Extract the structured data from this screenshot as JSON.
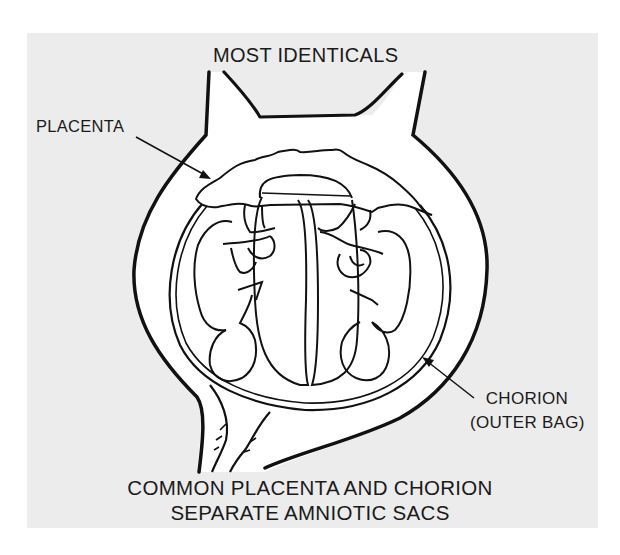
{
  "diagram": {
    "title": "MOST IDENTICALS",
    "labels": {
      "placenta": "PLACENTA",
      "chorion_line1": "CHORION",
      "chorion_line2": "(OUTER BAG)"
    },
    "caption": {
      "line1": "COMMON PLACENTA AND CHORION",
      "line2": "SEPARATE AMNIOTIC SACS"
    },
    "colors": {
      "background": "#ffffff",
      "panel": "#ececec",
      "ink": "#111111",
      "fill": "#ffffff"
    }
  }
}
